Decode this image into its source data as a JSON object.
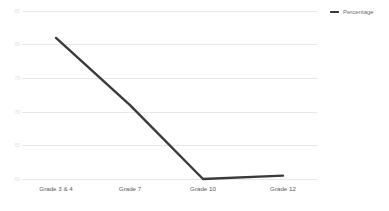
{
  "chart_data": {
    "type": "line",
    "title": "",
    "subtitle": "",
    "xlabel": "",
    "ylabel": "",
    "categories": [
      "Grade 3 & 4",
      "Grade 7",
      "Grade 10",
      "Grade 12"
    ],
    "series": [
      {
        "name": "Percentage",
        "color": "#3a3a3a",
        "values": [
          81,
          71,
          60,
          60.5
        ]
      }
    ],
    "ylim": [
      60,
      85
    ],
    "yticks": [
      85,
      80,
      75,
      70,
      65,
      60
    ],
    "ytick_labels": [
      "85",
      "80",
      "75",
      "70",
      "65",
      "60"
    ],
    "grid": true,
    "grid_color": "#e8e8e8",
    "legend": {
      "position": "top-right",
      "entries": [
        {
          "label": "Percentage",
          "marker": "line-swatch",
          "color": "#3a3a3a"
        }
      ]
    },
    "background": "#ffffff",
    "axis_label_color": "#5a5a5a",
    "ytick_label_color": "#e0e0e0"
  }
}
